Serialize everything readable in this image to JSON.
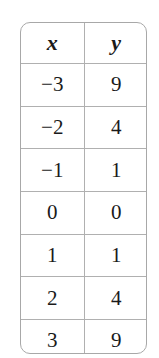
{
  "table": {
    "headers": [
      "x",
      "y"
    ],
    "rows": [
      [
        "−3",
        "9"
      ],
      [
        "−2",
        "4"
      ],
      [
        "−1",
        "1"
      ],
      [
        "0",
        "0"
      ],
      [
        "1",
        "1"
      ],
      [
        "2",
        "4"
      ],
      [
        "3",
        "9"
      ]
    ]
  },
  "colors": {
    "border": "#a8a8a8",
    "text": "#1a1a1a",
    "background": "#ffffff"
  }
}
